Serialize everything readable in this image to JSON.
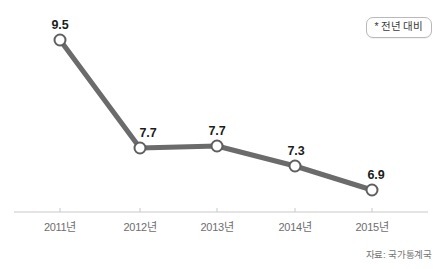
{
  "chart_data": {
    "type": "line",
    "title": "",
    "xlabel": "",
    "ylabel": "",
    "categories": [
      "2011년",
      "2012년",
      "2013년",
      "2014년",
      "2015년"
    ],
    "values": [
      9.5,
      7.7,
      7.7,
      7.3,
      6.9
    ],
    "value_labels": [
      "9.5",
      "7.7",
      "7.7",
      "7.3",
      "6.9"
    ],
    "series": [
      {
        "name": "전년 대비",
        "values": [
          9.5,
          7.7,
          7.7,
          7.3,
          6.9
        ]
      }
    ],
    "ylim": [
      6.0,
      10.2
    ],
    "grid": false,
    "legend_position": "top-right",
    "marker": "open-circle",
    "line_color": "#6b6b6b",
    "marker_fill": "#ffffff",
    "marker_stroke": "#5f5f5f",
    "axis_color": "#c9c9c9",
    "label_color": "#1c1c1c",
    "tick_label_color": "#6e6e6e"
  },
  "legend": {
    "badge_text": "* 전년 대비"
  },
  "footer": {
    "source": "자료: 국가통계국"
  },
  "geometry": {
    "points": [
      {
        "x": 60,
        "y": 40
      },
      {
        "x": 140,
        "y": 148
      },
      {
        "x": 217,
        "y": 146
      },
      {
        "x": 295,
        "y": 166
      },
      {
        "x": 372,
        "y": 190
      }
    ],
    "label_positions": [
      {
        "x": 60,
        "y": 32
      },
      {
        "x": 148,
        "y": 140
      },
      {
        "x": 217,
        "y": 138
      },
      {
        "x": 296,
        "y": 158
      },
      {
        "x": 376,
        "y": 182
      }
    ],
    "tick_positions": [
      60,
      140,
      217,
      295,
      372
    ],
    "axis_y": 212,
    "axis_x1": 14,
    "axis_x2": 428,
    "tick_label_y": 218
  }
}
